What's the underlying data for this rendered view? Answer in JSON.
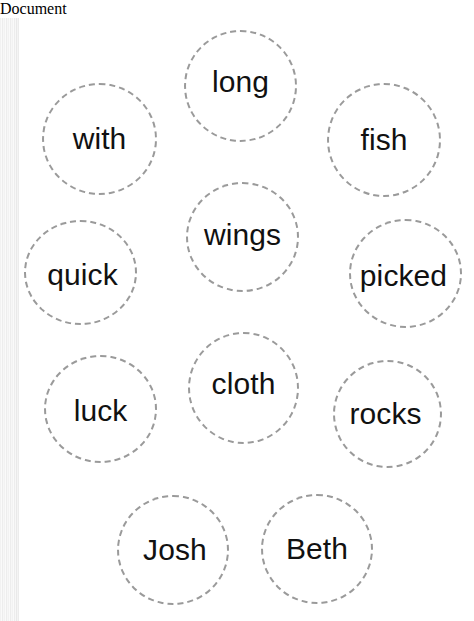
{
  "page": {
    "kind": "word-sort-worksheet",
    "background_color": "#ffffff",
    "width": 474,
    "height": 603,
    "edge_artifact": {
      "present": true,
      "side": "left",
      "color": "#f2f2f2"
    }
  },
  "style": {
    "bubble_border_color": "#9a9a9a",
    "bubble_border_style": "dashed",
    "text_color": "#111111"
  },
  "bubbles": [
    {
      "word": "with",
      "x": 42,
      "y": 65,
      "w": 115,
      "h": 112,
      "text_dx": 0,
      "text_dy": 0,
      "font_size": 30
    },
    {
      "word": "long",
      "x": 184,
      "y": 12,
      "w": 113,
      "h": 112,
      "text_dx": 0,
      "text_dy": -4,
      "font_size": 30
    },
    {
      "word": "fish",
      "x": 327,
      "y": 65,
      "w": 114,
      "h": 114,
      "text_dx": 0,
      "text_dy": 0,
      "font_size": 30
    },
    {
      "word": "quick",
      "x": 24,
      "y": 202,
      "w": 113,
      "h": 105,
      "text_dx": 2,
      "text_dy": 2,
      "font_size": 30
    },
    {
      "word": "wings",
      "x": 186,
      "y": 164,
      "w": 113,
      "h": 110,
      "text_dx": 0,
      "text_dy": -2,
      "font_size": 30
    },
    {
      "word": "picked",
      "x": 349,
      "y": 201,
      "w": 113,
      "h": 109,
      "text_dx": -2,
      "text_dy": 2,
      "font_size": 30
    },
    {
      "word": "luck",
      "x": 44,
      "y": 337,
      "w": 113,
      "h": 108,
      "text_dx": 0,
      "text_dy": 2,
      "font_size": 30
    },
    {
      "word": "cloth",
      "x": 188,
      "y": 314,
      "w": 111,
      "h": 112,
      "text_dx": 0,
      "text_dy": -4,
      "font_size": 30
    },
    {
      "word": "rocks",
      "x": 333,
      "y": 342,
      "w": 109,
      "h": 108,
      "text_dx": -2,
      "text_dy": 0,
      "font_size": 30
    },
    {
      "word": "Josh",
      "x": 117,
      "y": 477,
      "w": 112,
      "h": 110,
      "text_dx": 2,
      "text_dy": 0,
      "font_size": 30
    },
    {
      "word": "Beth",
      "x": 261,
      "y": 476,
      "w": 112,
      "h": 110,
      "text_dx": 0,
      "text_dy": 0,
      "font_size": 30
    }
  ]
}
